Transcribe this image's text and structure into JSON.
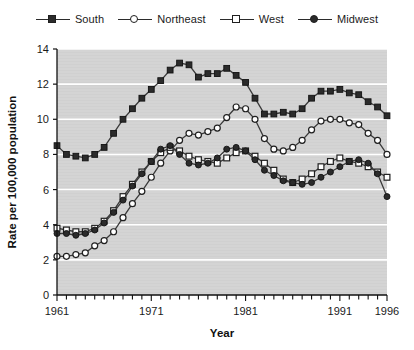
{
  "legend": {
    "position": "top-center",
    "entries": [
      {
        "label": "South",
        "marker": "square-filled",
        "color": "#2b2b2b"
      },
      {
        "label": "Northeast",
        "marker": "circle-open",
        "color": "#2b2b2b"
      },
      {
        "label": "West",
        "marker": "square-open",
        "color": "#2b2b2b"
      },
      {
        "label": "Midwest",
        "marker": "circle-filled",
        "color": "#2b2b2b"
      }
    ]
  },
  "chart_data": {
    "type": "line",
    "title": "",
    "xlabel": "Year",
    "ylabel": "Rate per 100,000 population",
    "xlim": [
      1961,
      1996
    ],
    "ylim": [
      0,
      14
    ],
    "ytick_values": [
      0,
      2,
      4,
      6,
      8,
      10,
      12,
      14
    ],
    "ytick_labels": [
      "0",
      "2",
      "4",
      "6",
      "8",
      "10",
      "12",
      "14"
    ],
    "xtick_labels": [
      "1961",
      "1971",
      "1981",
      "1991",
      "1996"
    ],
    "xtick_values": [
      1961,
      1971,
      1981,
      1991,
      1996
    ],
    "xticks_minor_every": 1,
    "grid": "horizontal-white",
    "plot_background": "#d4d4d4",
    "x": [
      1961,
      1962,
      1963,
      1964,
      1965,
      1966,
      1967,
      1968,
      1969,
      1970,
      1971,
      1972,
      1973,
      1974,
      1975,
      1976,
      1977,
      1978,
      1979,
      1980,
      1981,
      1982,
      1983,
      1984,
      1985,
      1986,
      1987,
      1988,
      1989,
      1990,
      1991,
      1992,
      1993,
      1994,
      1995,
      1996
    ],
    "series": [
      {
        "name": "South",
        "marker": "square-filled",
        "values": [
          8.5,
          8.0,
          7.9,
          7.8,
          8.0,
          8.4,
          9.2,
          10.0,
          10.6,
          11.2,
          11.7,
          12.2,
          12.8,
          13.2,
          13.1,
          12.4,
          12.6,
          12.6,
          12.9,
          12.5,
          12.1,
          11.2,
          10.3,
          10.3,
          10.4,
          10.3,
          10.6,
          11.2,
          11.6,
          11.6,
          11.7,
          11.5,
          11.4,
          11.0,
          10.7,
          10.2
        ]
      },
      {
        "name": "Northeast",
        "marker": "circle-open",
        "values": [
          2.2,
          2.2,
          2.3,
          2.4,
          2.8,
          3.1,
          3.6,
          4.4,
          5.2,
          5.9,
          6.7,
          7.5,
          8.2,
          8.8,
          9.2,
          9.1,
          9.3,
          9.5,
          10.1,
          10.7,
          10.6,
          10.0,
          8.9,
          8.3,
          8.2,
          8.4,
          8.8,
          9.4,
          9.9,
          10.0,
          10.0,
          9.8,
          9.7,
          9.2,
          8.8,
          8.0
        ]
      },
      {
        "name": "West",
        "marker": "square-open",
        "values": [
          3.8,
          3.7,
          3.6,
          3.6,
          3.8,
          4.2,
          4.8,
          5.6,
          6.3,
          7.0,
          7.6,
          8.1,
          8.4,
          8.2,
          7.9,
          7.7,
          7.6,
          7.5,
          7.8,
          8.1,
          8.2,
          7.9,
          7.5,
          7.1,
          6.6,
          6.4,
          6.6,
          6.9,
          7.3,
          7.6,
          7.8,
          7.6,
          7.5,
          7.3,
          7.0,
          6.7
        ]
      },
      {
        "name": "Midwest",
        "marker": "circle-filled",
        "values": [
          3.5,
          3.5,
          3.4,
          3.5,
          3.7,
          4.1,
          4.7,
          5.4,
          6.2,
          6.9,
          7.6,
          8.3,
          8.5,
          8.0,
          7.5,
          7.4,
          7.5,
          7.8,
          8.3,
          8.4,
          8.2,
          7.7,
          7.1,
          6.8,
          6.5,
          6.4,
          6.3,
          6.4,
          6.7,
          7.0,
          7.3,
          7.6,
          7.7,
          7.5,
          6.9,
          5.6
        ]
      }
    ]
  }
}
